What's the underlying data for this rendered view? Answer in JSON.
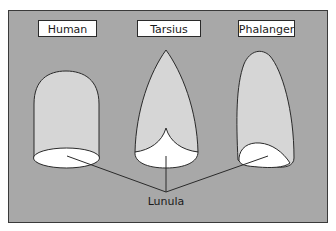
{
  "diagram": {
    "labels": {
      "human": "Human",
      "tarsius": "Tarsius",
      "phalanger": "Phalanger",
      "lunula": "Lunula"
    },
    "colors": {
      "panel_background": "#a8a8a8",
      "panel_border": "#3a3a3a",
      "nail_fill": "#d6d6d6",
      "lunula_fill": "#ffffff",
      "outline": "#2a2a2a",
      "label_box_fill": "#ffffff"
    }
  }
}
